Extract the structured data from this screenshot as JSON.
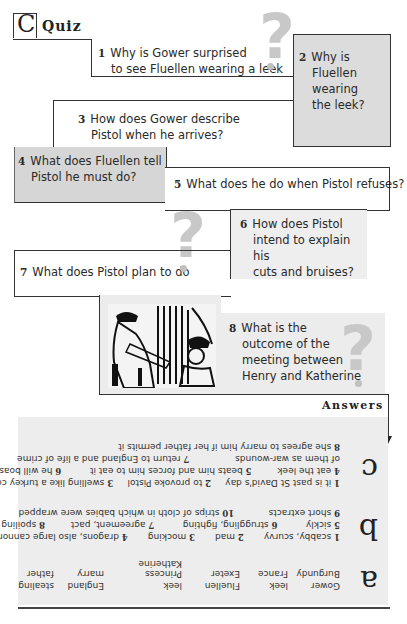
{
  "section": {
    "letter": "C",
    "title": "Quiz"
  },
  "questions": [
    {
      "num": "1",
      "line1": "Why is Gower surprised",
      "line2": "to see Fluellen wearing a leek"
    },
    {
      "num": "2",
      "lines": [
        "Why is",
        "Fluellen",
        "wearing",
        "the leek?"
      ]
    },
    {
      "num": "3",
      "line1": "How does Gower describe",
      "line2": "Pistol when he arrives?"
    },
    {
      "num": "4",
      "line1": "What does Fluellen tell",
      "line2": "Pistol he must do?"
    },
    {
      "num": "5",
      "line1": "What does he do when Pistol refuses?"
    },
    {
      "num": "6",
      "lines": [
        "How does Pistol",
        "intend to explain his",
        "cuts and bruises?"
      ]
    },
    {
      "num": "7",
      "line1": "What does Pistol plan to do"
    },
    {
      "num": "8",
      "lines": [
        "What is the",
        "outcome of the",
        "meeting between",
        "Henry and Katherine"
      ]
    }
  ],
  "decor": {
    "question_mark": "?",
    "illustration_alt": "Woodcut illustration of Henry and Katherine"
  },
  "answers": {
    "heading": "Answers",
    "c": {
      "letter": "c",
      "lines": [
        [
          {
            "n": "1",
            "t": "it is past St David's day"
          },
          {
            "n": "2",
            "t": "to provoke Pistol"
          },
          {
            "n": "3",
            "t": "swelling like a turkey cock"
          }
        ],
        [
          {
            "n": "4",
            "t": "eat the leek"
          },
          {
            "n": "5",
            "t": "beats him and forces him to eat it"
          },
          {
            "n": "6",
            "t": "he will boast"
          }
        ],
        [
          {
            "n": "",
            "t": "of them as war-wounds"
          },
          {
            "n": "7",
            "t": "return to England and a life of crime"
          }
        ],
        [
          {
            "n": "8",
            "t": "she agrees to marry him if her father permits it"
          }
        ]
      ]
    },
    "b": {
      "letter": "b",
      "lines": [
        [
          {
            "n": "1",
            "t": "scabby, scurvy"
          },
          {
            "n": "2",
            "t": "mad"
          },
          {
            "n": "3",
            "t": "mocking"
          },
          {
            "n": "4",
            "t": "dragons, also large cannons"
          }
        ],
        [
          {
            "n": "5",
            "t": "sickly"
          },
          {
            "n": "6",
            "t": "struggling, fighting"
          },
          {
            "n": "7",
            "t": "agreement, pact"
          },
          {
            "n": "8",
            "t": "spoiling"
          }
        ],
        [
          {
            "n": "9",
            "t": "short extracts"
          },
          {
            "n": "10",
            "t": "strips of cloth in which babies were wrapped"
          }
        ]
      ]
    },
    "a": {
      "letter": "a",
      "words": [
        "Gower",
        "leek",
        "Fluellen",
        "leek",
        "England",
        "stealing",
        "Burgundy",
        "France",
        "Exeter",
        "Princess Katherine",
        "marry",
        "father"
      ]
    }
  }
}
